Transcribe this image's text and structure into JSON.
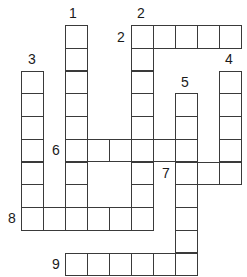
{
  "puzzle": {
    "type": "crossword",
    "layout": {
      "cell_width": 22,
      "cell_height": 22.75,
      "origin_x": 21,
      "origin_y": 25,
      "border_color": "#3a3a3a",
      "cell_fill": "#ffffff"
    },
    "entries": [
      {
        "number": "1",
        "direction": "down",
        "row": 0,
        "col": 2,
        "length": 9
      },
      {
        "number": "2",
        "direction": "across",
        "row": 0,
        "col": 5,
        "length": 5
      },
      {
        "number": "2",
        "direction": "down",
        "row": 0,
        "col": 5,
        "length": 9
      },
      {
        "number": "3",
        "direction": "down",
        "row": 2,
        "col": 0,
        "length": 7
      },
      {
        "number": "4",
        "direction": "down",
        "row": 2,
        "col": 9,
        "length": 5
      },
      {
        "number": "5",
        "direction": "down",
        "row": 3,
        "col": 7,
        "length": 8
      },
      {
        "number": "6",
        "direction": "across",
        "row": 5,
        "col": 2,
        "length": 6
      },
      {
        "number": "7",
        "direction": "across",
        "row": 6,
        "col": 7,
        "length": 3
      },
      {
        "number": "8",
        "direction": "across",
        "row": 8,
        "col": 0,
        "length": 6
      },
      {
        "number": "9",
        "direction": "across",
        "row": 10,
        "col": 2,
        "length": 6
      }
    ],
    "labels": [
      {
        "text": "1",
        "x": 69,
        "y": 6
      },
      {
        "text": "2",
        "x": 137,
        "y": 6
      },
      {
        "text": "2",
        "x": 117,
        "y": 30
      },
      {
        "text": "3",
        "x": 28,
        "y": 52
      },
      {
        "text": "4",
        "x": 225,
        "y": 52
      },
      {
        "text": "5",
        "x": 181,
        "y": 75
      },
      {
        "text": "6",
        "x": 52,
        "y": 143
      },
      {
        "text": "7",
        "x": 162,
        "y": 166
      },
      {
        "text": "8",
        "x": 8,
        "y": 211
      },
      {
        "text": "9",
        "x": 52,
        "y": 257
      }
    ]
  }
}
